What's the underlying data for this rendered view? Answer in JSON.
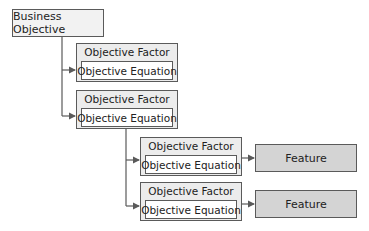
{
  "diagram": {
    "root": {
      "label": "Business Objective"
    },
    "factors": [
      {
        "title": "Objective Factor",
        "equation": "Objective Equation"
      },
      {
        "title": "Objective Factor",
        "equation": "Objective Equation"
      },
      {
        "title": "Objective Factor",
        "equation": "Objective Equation"
      },
      {
        "title": "Objective Factor",
        "equation": "Objective Equation"
      }
    ],
    "features": [
      {
        "label": "Feature"
      },
      {
        "label": "Feature"
      }
    ],
    "colors": {
      "border": "#5a5a5a",
      "factor_fill": "#ececec",
      "feature_fill": "#d4d4d4",
      "connector": "#5a5a5a"
    }
  }
}
